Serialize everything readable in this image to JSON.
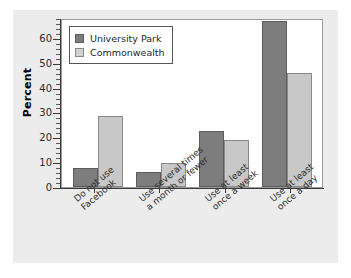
{
  "chart_data": {
    "type": "bar",
    "title": "",
    "xlabel": "",
    "ylabel": "Percent",
    "ylim": [
      0,
      68
    ],
    "yticks": [
      0,
      10,
      20,
      30,
      40,
      50,
      60
    ],
    "grid": false,
    "legend_position": "top-left",
    "categories": [
      "Do not use Facebook",
      "Use several times a month or fewer",
      "Use at least once a week",
      "Use at least once a day"
    ],
    "category_lines": [
      [
        "Do not use",
        "Facebook"
      ],
      [
        "Use several times",
        "a month or fewer"
      ],
      [
        "Use at least",
        "once a week"
      ],
      [
        "Use at least",
        "once a day"
      ]
    ],
    "series": [
      {
        "name": "University Park",
        "color": "#7d7d7d",
        "values": [
          7.5,
          6,
          22.5,
          67
        ]
      },
      {
        "name": "Commonwealth",
        "color": "#c8c8c8",
        "values": [
          28.5,
          9.5,
          19,
          46
        ]
      }
    ]
  },
  "figure": {
    "panel_color": "#ececed",
    "plot_background": "#ffffff",
    "axis_color": "#3a3a3a"
  }
}
